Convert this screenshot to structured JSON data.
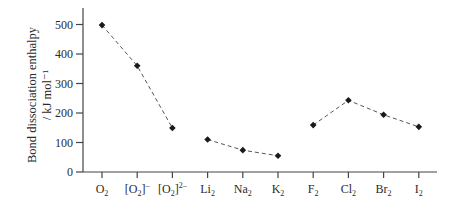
{
  "chart_data": {
    "type": "line",
    "title": "",
    "xlabel": "",
    "ylabel": "Bond dissociation enthalpy",
    "ylabel_unit": "/ kJ mol⁻¹",
    "categories": [
      {
        "base": "O",
        "sub": "2",
        "bracket": false,
        "sup": ""
      },
      {
        "base": "O",
        "sub": "2",
        "bracket": true,
        "sup": "–"
      },
      {
        "base": "O",
        "sub": "2",
        "bracket": true,
        "sup": "2–"
      },
      {
        "base": "Li",
        "sub": "2",
        "bracket": false,
        "sup": ""
      },
      {
        "base": "Na",
        "sub": "2",
        "bracket": false,
        "sup": ""
      },
      {
        "base": "K",
        "sub": "2",
        "bracket": false,
        "sup": ""
      },
      {
        "base": "F",
        "sub": "2",
        "bracket": false,
        "sup": ""
      },
      {
        "base": "Cl",
        "sub": "2",
        "bracket": false,
        "sup": ""
      },
      {
        "base": "Br",
        "sub": "2",
        "bracket": false,
        "sup": ""
      },
      {
        "base": "I",
        "sub": "2",
        "bracket": false,
        "sup": ""
      }
    ],
    "category_labels": [
      "O2",
      "[O2]-",
      "[O2]2-",
      "Li2",
      "Na2",
      "K2",
      "F2",
      "Cl2",
      "Br2",
      "I2"
    ],
    "values": [
      498,
      360,
      149,
      110,
      74,
      55,
      159,
      243,
      194,
      153
    ],
    "segments": [
      [
        0,
        1,
        2
      ],
      [
        3,
        4,
        5
      ],
      [
        6,
        7,
        8,
        9
      ]
    ],
    "ylim": [
      0,
      550
    ],
    "yticks": [
      0,
      100,
      200,
      300,
      400,
      500
    ],
    "grid": false,
    "legend": null,
    "marker": "diamond",
    "line_style": "dashed",
    "colors": {
      "marker": "#1a1a1a",
      "line": "#555555",
      "axis": "#444444",
      "text": "#2a2a2a"
    }
  }
}
